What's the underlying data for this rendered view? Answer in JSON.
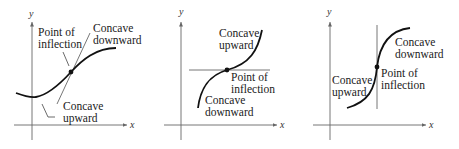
{
  "panels": [
    {
      "axis_x_label": "x",
      "axis_y_label": "y",
      "labels": {
        "inflection_line1": "Point of",
        "inflection_line2": "inflection",
        "down_line1": "Concave",
        "down_line2": "downward",
        "up_line1": "Concave",
        "up_line2": "upward"
      },
      "tangent": "slanted"
    },
    {
      "axis_x_label": "x",
      "axis_y_label": "y",
      "labels": {
        "up_line1": "Concave",
        "up_line2": "upward",
        "inflection_line1": "Point of",
        "inflection_line2": "inflection",
        "down_line1": "Concave",
        "down_line2": "downward"
      },
      "tangent": "horizontal"
    },
    {
      "axis_x_label": "x",
      "axis_y_label": "y",
      "labels": {
        "down_line1": "Concave",
        "down_line2": "downward",
        "up_line1": "Concave",
        "up_line2": "upward",
        "inflection_line1": "Point of",
        "inflection_line2": "inflection"
      },
      "tangent": "vertical"
    }
  ],
  "colors": {
    "curve": "#111111",
    "axis": "#666666",
    "tangent": "#777777"
  }
}
